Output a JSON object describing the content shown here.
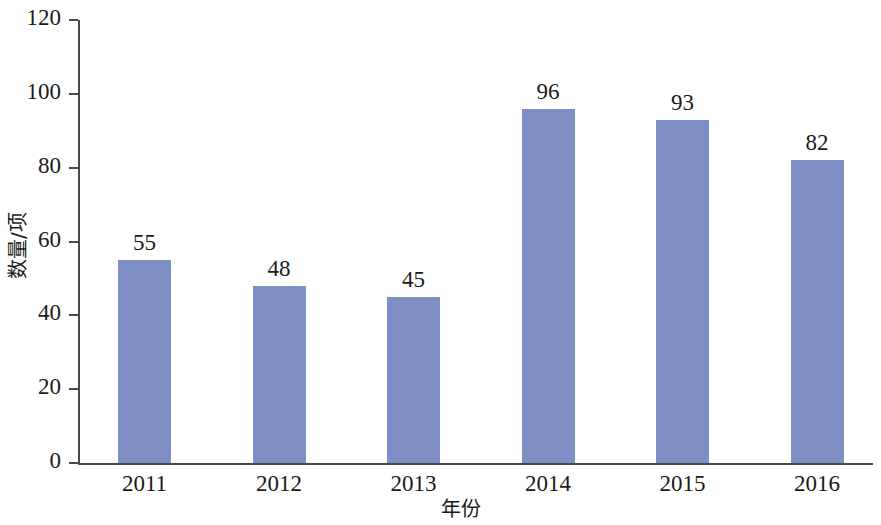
{
  "chart_data": {
    "type": "bar",
    "title": "",
    "categories": [
      "2011",
      "2012",
      "2013",
      "2014",
      "2015",
      "2016"
    ],
    "values": [
      55,
      48,
      45,
      96,
      93,
      82
    ],
    "value_labels": [
      "55",
      "48",
      "45",
      "96",
      "93",
      "82"
    ],
    "xlabel": "年份",
    "ylabel": "数量/项",
    "ylim": [
      0,
      120
    ],
    "yticks": [
      0,
      20,
      40,
      60,
      80,
      100,
      120
    ],
    "ytick_labels": [
      "0",
      "20",
      "40",
      "60",
      "80",
      "100",
      "120"
    ],
    "grid": false,
    "legend": false,
    "bar_color": "#7d8fc4",
    "axis_color": "#4a4a4a",
    "text_color": "#1a1a1a",
    "background": "#ffffff"
  }
}
